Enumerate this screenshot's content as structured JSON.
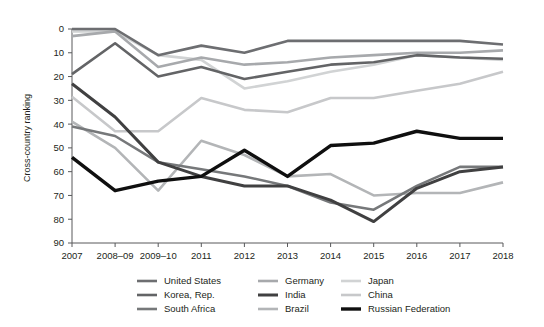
{
  "chart_data": {
    "type": "line",
    "title": "",
    "subtitle": "",
    "xlabel": "",
    "ylabel": "Cross-country ranking",
    "categories": [
      "2007",
      "2008–09",
      "2009–10",
      "2011",
      "2012",
      "2013",
      "2014",
      "2015",
      "2016",
      "2017",
      "2018"
    ],
    "yticks": [
      0,
      10,
      20,
      30,
      40,
      50,
      60,
      70,
      80,
      90
    ],
    "ylim": [
      0,
      90
    ],
    "y_axis_inverted": true,
    "grid": false,
    "legend_position": "bottom",
    "legend_columns": 3,
    "series": [
      {
        "name": "United States",
        "color": "#6d6e71",
        "width": 2.6,
        "values": [
          0,
          0,
          11,
          7,
          10,
          5,
          5,
          5,
          5,
          5,
          6.5
        ]
      },
      {
        "name": "Korea, Rep.",
        "color": "#636466",
        "width": 2.6,
        "values": [
          19,
          6,
          20,
          16,
          21,
          18,
          15,
          14,
          11,
          12,
          12.5
        ]
      },
      {
        "name": "South Africa",
        "color": "#76787a",
        "width": 2.6,
        "values": [
          41,
          45,
          56,
          59,
          62,
          66,
          73,
          76,
          66,
          58,
          58
        ]
      },
      {
        "name": "Germany",
        "color": "#a7a9ac",
        "width": 2.6,
        "values": [
          3,
          1,
          16,
          12,
          15,
          14,
          12,
          11,
          10,
          10,
          9
        ]
      },
      {
        "name": "India",
        "color": "#404041",
        "width": 3.0,
        "values": [
          23,
          37,
          56,
          62,
          66,
          66,
          72,
          81,
          67,
          60,
          58
        ]
      },
      {
        "name": "Brazil",
        "color": "#b3b5b7",
        "width": 2.6,
        "values": [
          39,
          50,
          68,
          47,
          53,
          62,
          61,
          70,
          69,
          69,
          64.5
        ]
      },
      {
        "name": "Japan",
        "color": "#d1d3d4",
        "width": 2.6,
        "values": [
          1,
          1,
          11,
          13,
          25,
          22,
          18,
          15,
          11,
          12,
          13
        ]
      },
      {
        "name": "China",
        "color": "#c7c8ca",
        "width": 2.6,
        "values": [
          28.5,
          43,
          43,
          29,
          34,
          35,
          29,
          29,
          26,
          23,
          18
        ]
      },
      {
        "name": "Russian Federation",
        "color": "#0f0f0f",
        "width": 3.4,
        "values": [
          54,
          68,
          64,
          62,
          51,
          62,
          49,
          48,
          43,
          46,
          46
        ]
      }
    ],
    "legend_layout": [
      [
        "United States",
        "Germany",
        "Japan"
      ],
      [
        "Korea, Rep.",
        "India",
        "China"
      ],
      [
        "South Africa",
        "Brazil",
        "Russian Federation"
      ]
    ]
  }
}
